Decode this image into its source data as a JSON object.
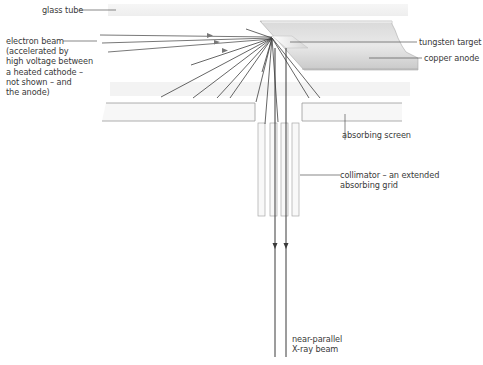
{
  "diagram": {
    "type": "labelled schematic",
    "labels": {
      "glass_tube": "glass tube",
      "electron_beam": "electron beam\n(accelerated by\nhigh voltage between\na heated cathode –\nnot shown – and\nthe anode)",
      "tungsten_target": "tungsten target",
      "copper_anode": "copper anode",
      "absorbing_screen": "absorbing screen",
      "collimator": "collimator – an extended\nabsorbing grid",
      "xray_beam": "near-parallel\nX-ray beam"
    },
    "colors": {
      "line": "#4a4a4a",
      "leader": "#555555",
      "glass": "#f1f1f1",
      "anode_light": "#e6e6e6",
      "anode_dark": "#bdbdbd",
      "screen_edge": "#9a9a9a"
    }
  }
}
